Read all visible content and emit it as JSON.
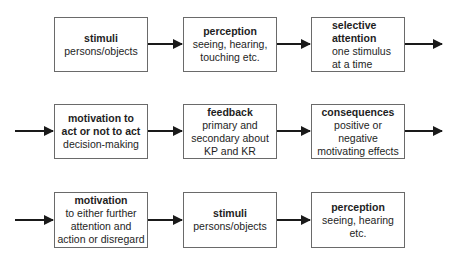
{
  "diagram": {
    "rows": [
      {
        "entry_arrow": false,
        "exit_arrow": true,
        "boxes": [
          {
            "title": "stimuli",
            "body": "persons/objects"
          },
          {
            "title": "perception",
            "body": "seeing, hearing,\ntouching etc."
          },
          {
            "title": "selective\nattention",
            "body": "one stimulus\nat a time"
          }
        ]
      },
      {
        "entry_arrow": true,
        "exit_arrow": true,
        "boxes": [
          {
            "title": "motivation to\nact or not to act",
            "body": "decision-making"
          },
          {
            "title": "feedback",
            "body": "primary and\nsecondary about\nKP and KR"
          },
          {
            "title": "consequences",
            "body": "positive or\nnegative\nmotivating effects"
          }
        ]
      },
      {
        "entry_arrow": true,
        "exit_arrow": false,
        "boxes": [
          {
            "title": "motivation",
            "body": "to either further\nattention and\naction or disregard"
          },
          {
            "title": "stimuli",
            "body": "persons/objects"
          },
          {
            "title": "perception",
            "body": "seeing, hearing\netc."
          }
        ]
      }
    ]
  }
}
